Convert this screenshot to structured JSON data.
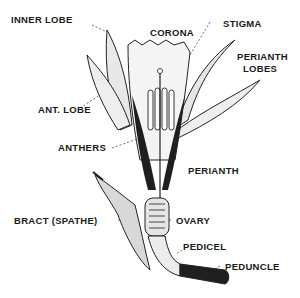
{
  "diagram": {
    "labels": {
      "inner_lobe": "INNER LOBE",
      "corona": "CORONA",
      "stigma": "STIGMA",
      "perianth_lobes_1": "PERIANTH",
      "perianth_lobes_2": "LOBES",
      "ant_lobe": "ANT. LOBE",
      "anthers": "ANTHERS",
      "perianth": "PERIANTH",
      "bract": "BRACT (SPATHE)",
      "ovary": "OVARY",
      "pedicel": "PEDICEL",
      "peduncle": "PEDUNCLE"
    },
    "colors": {
      "ink": "#1a1a1a",
      "shade": "#9a9a9a",
      "light": "#dcdcdc",
      "background": "#ffffff"
    }
  }
}
